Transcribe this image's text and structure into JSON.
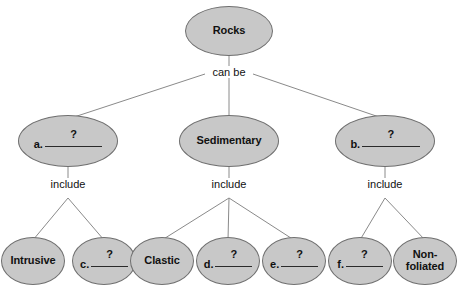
{
  "diagram": {
    "type": "concept-map",
    "root": {
      "id": "rocks",
      "label": "Rocks",
      "cx": 229,
      "cy": 31,
      "rx": 44,
      "ry": 25
    },
    "relation_labels": [
      {
        "id": "can-be",
        "text": "can be",
        "x": 229,
        "y": 74
      },
      {
        "id": "include-left",
        "text": "include",
        "x": 68,
        "y": 186
      },
      {
        "id": "include-middle",
        "text": "include",
        "x": 229,
        "y": 186
      },
      {
        "id": "include-right",
        "text": "include",
        "x": 385,
        "y": 186
      }
    ],
    "level2": [
      {
        "id": "rock-type-a",
        "prefix": "a.",
        "question": "?",
        "label": "",
        "blank": true,
        "cx": 68,
        "cy": 141,
        "rx": 50,
        "ry": 26
      },
      {
        "id": "sedimentary",
        "prefix": "",
        "question": "",
        "label": "Sedimentary",
        "blank": false,
        "cx": 229,
        "cy": 141,
        "rx": 50,
        "ry": 26
      },
      {
        "id": "rock-type-b",
        "prefix": "b.",
        "question": "?",
        "label": "",
        "blank": true,
        "cx": 385,
        "cy": 141,
        "rx": 50,
        "ry": 26
      }
    ],
    "level3": [
      {
        "id": "intrusive",
        "prefix": "",
        "question": "",
        "label": "Intrusive",
        "blank": false,
        "cx": 33,
        "cy": 261,
        "rx": 32,
        "ry": 24,
        "parent": "rock-type-a"
      },
      {
        "id": "igneous-c",
        "prefix": "c.",
        "question": "?",
        "label": "",
        "blank": true,
        "cx": 104,
        "cy": 261,
        "rx": 32,
        "ry": 24,
        "parent": "rock-type-a"
      },
      {
        "id": "clastic",
        "prefix": "",
        "question": "",
        "label": "Clastic",
        "blank": false,
        "cx": 162,
        "cy": 261,
        "rx": 32,
        "ry": 24,
        "parent": "sedimentary"
      },
      {
        "id": "sedimentary-d",
        "prefix": "d.",
        "question": "?",
        "label": "",
        "blank": true,
        "cx": 228,
        "cy": 261,
        "rx": 32,
        "ry": 24,
        "parent": "sedimentary"
      },
      {
        "id": "sedimentary-e",
        "prefix": "e.",
        "question": "?",
        "label": "",
        "blank": true,
        "cx": 294,
        "cy": 261,
        "rx": 32,
        "ry": 24,
        "parent": "sedimentary"
      },
      {
        "id": "metamorphic-f",
        "prefix": "f.",
        "question": "?",
        "label": "",
        "blank": true,
        "cx": 360,
        "cy": 261,
        "rx": 32,
        "ry": 24,
        "parent": "rock-type-b"
      },
      {
        "id": "non-foliated",
        "prefix": "",
        "question": "",
        "label": "Non-\nfoliated",
        "blank": false,
        "cx": 425,
        "cy": 261,
        "rx": 32,
        "ry": 24,
        "parent": "rock-type-b"
      }
    ],
    "style": {
      "node_fill": "#c8c8c8",
      "node_stroke": "#6f6f6f",
      "edge_stroke": "#8a8a8a",
      "text_color": "#111111",
      "background": "#ffffff"
    }
  }
}
